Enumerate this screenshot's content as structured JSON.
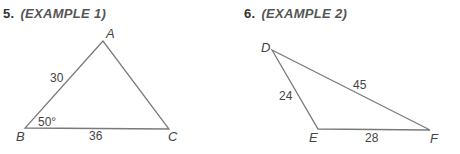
{
  "problems": [
    {
      "number": "5.",
      "example": "(EXAMPLE 1)",
      "vertices": {
        "A": "A",
        "B": "B",
        "C": "C"
      },
      "labels": {
        "AB": "30",
        "BC": "36",
        "angle_B": "50°"
      }
    },
    {
      "number": "6.",
      "example": "(EXAMPLE 2)",
      "vertices": {
        "D": "D",
        "E": "E",
        "F": "F"
      },
      "labels": {
        "DE": "24",
        "DF": "45",
        "EF": "28"
      }
    }
  ],
  "colors": {
    "line": "#7a7a7a",
    "text": "#444444"
  }
}
